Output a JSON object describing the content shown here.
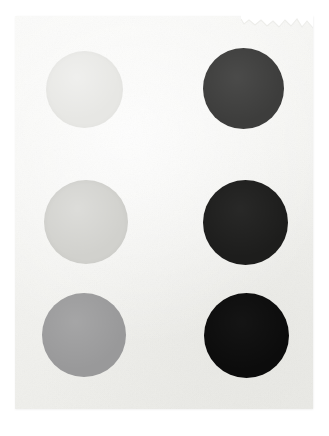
{
  "artwork": {
    "title": "Grayscale Value Swatch Card",
    "medium_note": "photographed paper sheet",
    "paper_color": "#f4f4f2",
    "backdrop_color": "#ffffff",
    "paper": {
      "left": 15,
      "top": 16,
      "width": 298,
      "height": 393,
      "torn_edge_location": "top-right"
    },
    "grid": {
      "columns": 2,
      "rows": 3,
      "arrangement": "2 columns x 3 rows",
      "ordering": "lightest top-left to darkest bottom-right"
    }
  },
  "swatches": [
    {
      "id": "swatch-1",
      "name": "light-gray-circle-top-left",
      "label": "Light Gray",
      "column": 1,
      "row": 1,
      "color": "#e7e7e4",
      "value_percent": 9,
      "left": 46,
      "top": 51,
      "size": 77
    },
    {
      "id": "swatch-2",
      "name": "dark-gray-circle-top-right",
      "label": "Dark Gray",
      "column": 2,
      "row": 1,
      "color": "#3d3d3c",
      "value_percent": 76,
      "left": 203,
      "top": 48,
      "size": 81
    },
    {
      "id": "swatch-3",
      "name": "pale-gray-circle-middle-left",
      "label": "Pale Gray",
      "column": 1,
      "row": 2,
      "color": "#d1d1cd",
      "value_percent": 18,
      "left": 44,
      "top": 180,
      "size": 84
    },
    {
      "id": "swatch-4",
      "name": "very-dark-gray-circle-middle-right",
      "label": "Very Dark Gray",
      "column": 2,
      "row": 2,
      "color": "#1d1d1c",
      "value_percent": 89,
      "left": 203,
      "top": 180,
      "size": 85
    },
    {
      "id": "swatch-5",
      "name": "medium-gray-circle-bottom-left",
      "label": "Medium Gray",
      "column": 1,
      "row": 3,
      "color": "#99999a",
      "value_percent": 40,
      "left": 42,
      "top": 293,
      "size": 84
    },
    {
      "id": "swatch-6",
      "name": "near-black-circle-bottom-right",
      "label": "Near Black",
      "column": 2,
      "row": 3,
      "color": "#0c0c0c",
      "value_percent": 95,
      "left": 204,
      "top": 293,
      "size": 85
    }
  ]
}
